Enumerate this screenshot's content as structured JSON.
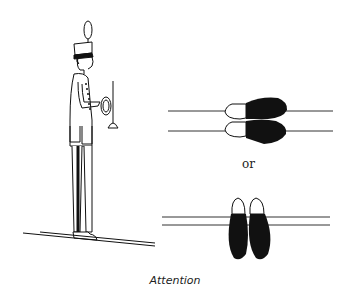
{
  "figure": {
    "caption": "Attention",
    "separator_text": "or",
    "foot_diagrams": [
      {
        "name": "feet-side-by-side-horizontal",
        "description": "feet together, toes pointing right, on two lines"
      },
      {
        "name": "feet-side-by-side-vertical",
        "description": "feet together, toes pointing up, on two lines"
      }
    ],
    "colors": {
      "ink": "#111111",
      "background": "#ffffff"
    }
  }
}
